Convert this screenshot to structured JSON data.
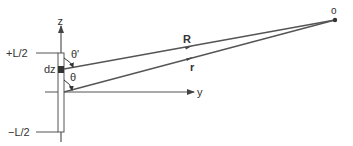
{
  "diagram": {
    "labels": {
      "z_axis": "z",
      "y_axis": "y",
      "top_end": "+L/2",
      "bottom_end": "−L/2",
      "element": "dz",
      "theta_prime": "θ'",
      "theta": "θ",
      "vector_R": "R",
      "vector_r": "r",
      "observation_point": "o"
    },
    "colors": {
      "line": "#555555",
      "element_fill": "#333333",
      "background": "#ffffff"
    }
  }
}
